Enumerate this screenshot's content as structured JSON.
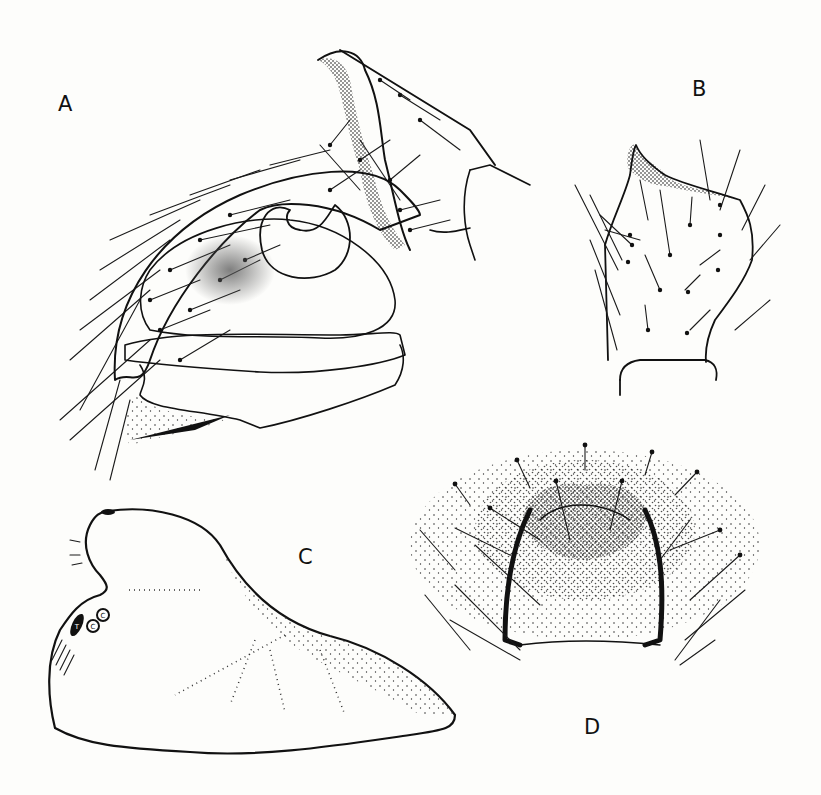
{
  "plate": {
    "background": "#fdfdfb",
    "ink_color": "#111111",
    "figures": [
      {
        "id": "A",
        "label": "A",
        "description": "Male palp, lateral view, with setose cymbium and stippled bulb"
      },
      {
        "id": "B",
        "label": "B",
        "description": "Palpal tibia with apical tooth and setae"
      },
      {
        "id": "C",
        "label": "C",
        "description": "Outline of structure with stippled ridges; small labelled circles"
      },
      {
        "id": "D",
        "label": "D",
        "description": "Epigynum, ventral view, heavily stippled with setae"
      }
    ],
    "figure_C_markers": [
      "T",
      "C",
      "C"
    ]
  }
}
